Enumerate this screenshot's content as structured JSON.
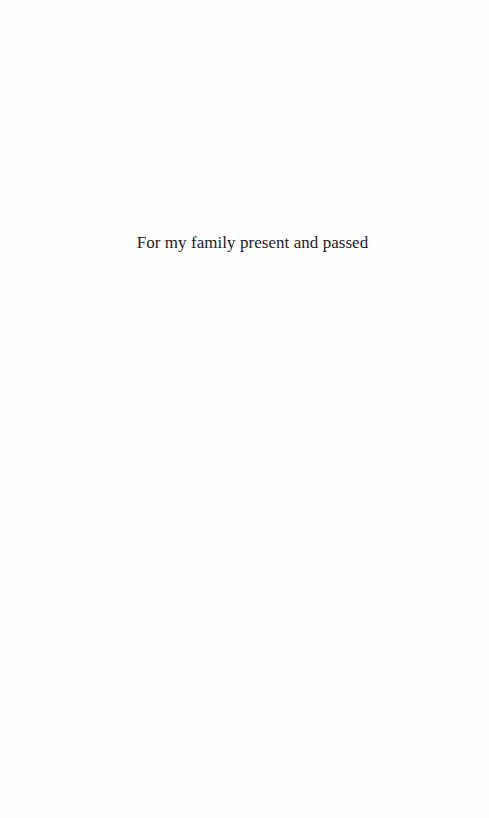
{
  "page": {
    "type": "dedication-page",
    "background_color": "#ffffff",
    "text_color": "#1c1c1c"
  },
  "dedication": {
    "text": "For my family present and passed"
  }
}
